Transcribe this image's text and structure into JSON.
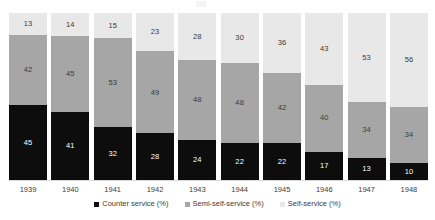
{
  "chart_data": {
    "type": "bar",
    "stacked": true,
    "title": "",
    "subtitle": "",
    "xlabel": "",
    "ylabel": "",
    "ylim": [
      0,
      100
    ],
    "grid": false,
    "legend_position": "bottom",
    "categories": [
      "1939",
      "1940",
      "1941",
      "1942",
      "1943",
      "1944",
      "1945",
      "1946",
      "1947",
      "1948"
    ],
    "series": [
      {
        "name": "Counter service (%)",
        "color": "#0d0d0d",
        "values": [
          45,
          41,
          32,
          28,
          24,
          22,
          22,
          17,
          13,
          10
        ]
      },
      {
        "name": "Semi-self-service (%)",
        "color": "#a6a6a6",
        "values": [
          42,
          45,
          53,
          49,
          48,
          48,
          42,
          40,
          34,
          34
        ]
      },
      {
        "name": "Self-service (%)",
        "color": "#e8e8e8",
        "values": [
          13,
          14,
          15,
          23,
          28,
          30,
          36,
          43,
          53,
          56
        ]
      }
    ],
    "data_labels": true,
    "axis_line_color": "#d9d9d9",
    "text_color": "#3b3b3b"
  },
  "legend": {
    "items": [
      {
        "label": "Counter service (%)",
        "color": "#0d0d0d"
      },
      {
        "label": "Semi-self-service (%)",
        "color": "#a6a6a6"
      },
      {
        "label": "Self-service (%)",
        "color": "#e8e8e8"
      }
    ]
  }
}
